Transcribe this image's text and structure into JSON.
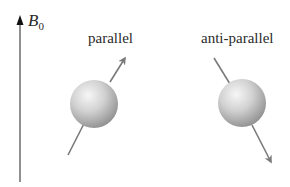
{
  "field": {
    "symbol": "B",
    "subscript": "0"
  },
  "states": [
    {
      "label": "parallel",
      "direction": "up"
    },
    {
      "label": "anti-parallel",
      "direction": "down"
    }
  ],
  "colors": {
    "axis": "#3a3a3a",
    "arrow": "#7a7a7a",
    "sphere_light": "#f4f4f4",
    "sphere_dark": "#8c8c8c"
  }
}
